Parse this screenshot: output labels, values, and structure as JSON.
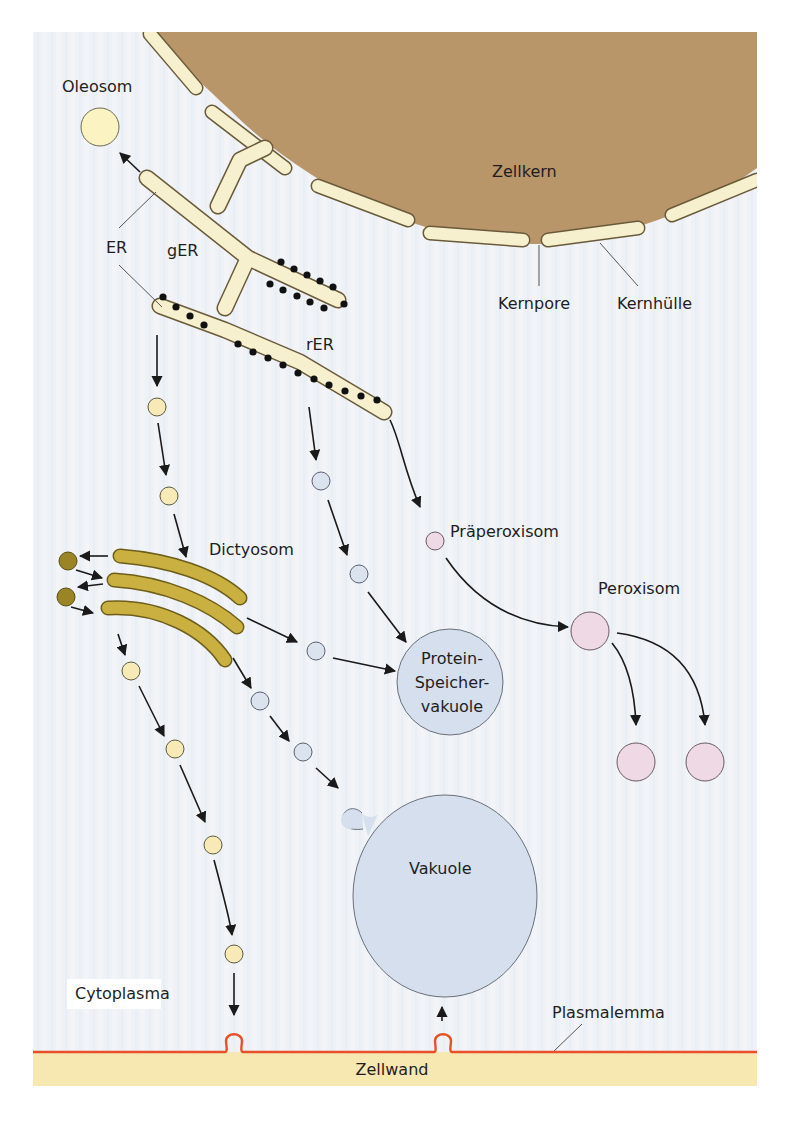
{
  "figure": {
    "colors": {
      "background_panel": "#eef1f6",
      "nucleus": "#b9956a",
      "nuclear_envelope": "#f6f0cf",
      "er": "#f6f0cf",
      "dictyosome": "#c9b040",
      "vesicle_yellow": "#f8eab6",
      "vesicle_blue": "#dbe3ef",
      "vesicle_pink": "#efd9e4",
      "vacuole": "#d6dfee",
      "cell_wall": "#f7e7b0",
      "plasmalemma": "#e8502a"
    },
    "labels": {
      "oleosom": "Oleosom",
      "zellkern": "Zellkern",
      "er": "ER",
      "ger": "gER",
      "rer": "rER",
      "kernpore": "Kernpore",
      "kernhuelle": "Kernhülle",
      "dictyosom": "Dictyosom",
      "praeperoxisom": "Präperoxisom",
      "peroxisom": "Peroxisom",
      "protein_line1": "Protein-",
      "protein_line2": "Speicher-",
      "protein_line3": "vakuole",
      "vakuole": "Vakuole",
      "cytoplasma": "Cytoplasma",
      "plasmalemma": "Plasmalemma",
      "zellwand": "Zellwand"
    }
  }
}
